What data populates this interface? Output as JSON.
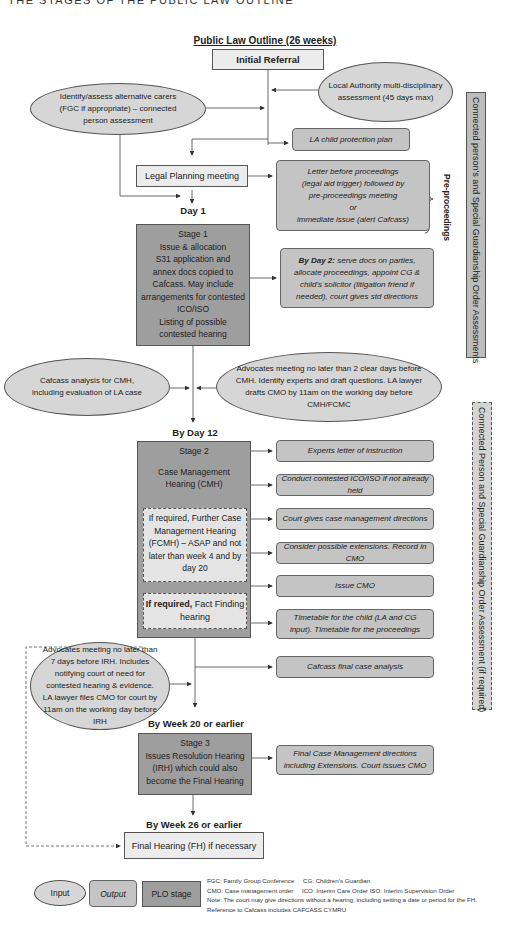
{
  "header": "THE STAGES OF THE PUBLIC LAW OUTLINE",
  "title": "Public Law Outline (26 weeks)",
  "nodes": {
    "initial_referral": "Initial Referral",
    "la_assessment": "Local Authority multi-disciplinary assessment (45 days max)",
    "alt_carers": "Identify/assess alternative carers (FGC if appropriate) – connected person assessment",
    "la_cpp": "LA child protection plan",
    "legal_planning": "Legal Planning meeting",
    "letter_before": [
      "Letter before proceedings",
      "(legal aid trigger) followed by",
      "pre-proceedings meeting",
      "or",
      "immediate issue (alert Cafcass)"
    ],
    "pre_proceedings": "Pre-proceedings",
    "day1": "Day 1",
    "stage1": [
      "Stage 1",
      "Issue & allocation",
      "S31 application and",
      "annex docs copied to",
      "Cafcass. May include",
      "arrangements for contested",
      "ICO/ISO",
      "Listing of possible",
      "contested hearing"
    ],
    "by_day2_bold": "By Day 2:",
    "by_day2_text": "serve docs on parties, allocate proceedings, appoint CG & child's solicitor (litigation friend if needed), court gives std directions",
    "cafcass_cmh": "Cafcass analysis for CMH, including evaluation of LA case",
    "advocates_cmh": "Advocates meeting no later than 2 clear days before CMH. Identify experts and draft questions. LA lawyer drafts CMO by 11am on the working day before CMH/FCMC",
    "by_day12": "By Day 12",
    "stage2_title": "Stage 2",
    "stage2_cmh": "Case Management Hearing (CMH)",
    "fcmh": "If required, Further Case Management Hearing (FCMH) – ASAP and not later than week 4 and by day 20",
    "fact_bold": "If required,",
    "fact_text": " Fact Finding hearing",
    "outputs2": [
      "Experts letter of instruction",
      "Conduct contested ICO/ISO if not already held",
      "Court gives case management directions",
      "Consider possible extensions. Record in CMO",
      "Issue CMO",
      "Timetable for the child (LA and CG input). Timetable for the proceedings",
      "Cafcass final case analysis"
    ],
    "advocates_irh": "Advocates meeting no later than 7 days before IRH. Includes notifying court of need for contested hearing & evidence. LA lawyer files CMO for court by 11am on the working day before IRH",
    "by_week20": "By Week 20 or earlier",
    "stage3": [
      "Stage 3",
      "Issues Resolution Hearing",
      "(IRH) which could also",
      "become the Final Hearing"
    ],
    "final_cmd": "Final Case Management directions including Extensions. Court issues CMO",
    "by_week26": "By Week 26 or earlier",
    "final_hearing": "Final Hearing (FH) if necessary"
  },
  "side_bars": {
    "top": "Connected person's and Special Guardianship Order Assessments",
    "bottom": "Connected Person and Special Guardianship Order Assessment (if required)"
  },
  "legend": {
    "input": "Input",
    "output": "Output",
    "stage": "PLO stage",
    "notes": [
      "FGC: Family Group Conference     CG: Children's Guardian",
      "CMO: Case management order     ICO: Interim Care Order ISO: Interim Supervision Order",
      "Note: The court may give directions without a hearing, including setting a date or period for the FH.",
      "Reference to Cafcass includes CAFCASS CYMRU"
    ]
  },
  "colors": {
    "stage": "#9e9e9e",
    "output": "#c4c4c4",
    "input": "#d6d6d6",
    "light": "#ececec"
  }
}
